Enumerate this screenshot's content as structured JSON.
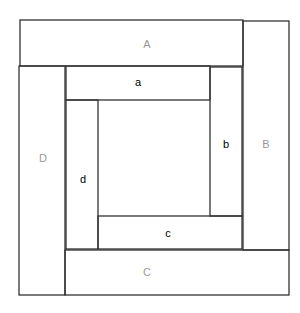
{
  "diagram": {
    "outer_labels": {
      "top": "A",
      "right": "B",
      "bottom": "C",
      "left": "D"
    },
    "inner_labels": {
      "top": "a",
      "right": "b",
      "bottom": "c",
      "left": "d"
    },
    "colors": {
      "stroke": "#333333",
      "outer_label": "#999999",
      "inner_label": "#000000"
    }
  }
}
